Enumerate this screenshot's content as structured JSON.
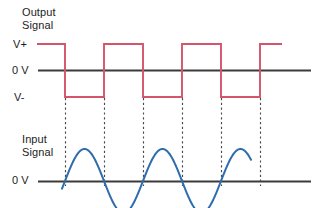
{
  "figure": {
    "title_output": "Output\nSignal",
    "title_input": "Input\nSignal",
    "axis_labels": {
      "v_plus": "V+",
      "zero_output": "0 V",
      "v_minus": "V-",
      "zero_input": "0 V"
    },
    "colors": {
      "output_wave": "#d4546b",
      "input_wave": "#2f6cab",
      "axis": "#3b3b3b",
      "dashed_guide": "#4a4a4a",
      "text": "#1c1c1c",
      "background": "#ffffff"
    }
  },
  "chart_data": {
    "type": "line",
    "grid": false,
    "legend": false,
    "panels": [
      {
        "name": "output-signal",
        "label": "Output\nSignal",
        "series_name": "Output Signal",
        "waveform": "square",
        "color": "#d4546b",
        "ylabel": "",
        "ytick_labels": [
          "V+",
          "0 V",
          "V-"
        ],
        "ytick_values": [
          1,
          0,
          -1
        ],
        "ylim": [
          -1.35,
          1.35
        ],
        "xlim": [
          0,
          319
        ],
        "starts_high": true,
        "x_start": 37,
        "x_end": 282,
        "transition_x": [
          65,
          104,
          143,
          182,
          221,
          260
        ],
        "levels_px": {
          "v_plus": 44,
          "zero": 70,
          "v_minus": 97
        },
        "points": [
          {
            "x": 37,
            "y": 1
          },
          {
            "x": 65,
            "y": 1
          },
          {
            "x": 65,
            "y": -1
          },
          {
            "x": 104,
            "y": -1
          },
          {
            "x": 104,
            "y": 1
          },
          {
            "x": 143,
            "y": 1
          },
          {
            "x": 143,
            "y": -1
          },
          {
            "x": 182,
            "y": -1
          },
          {
            "x": 182,
            "y": 1
          },
          {
            "x": 221,
            "y": 1
          },
          {
            "x": 221,
            "y": -1
          },
          {
            "x": 260,
            "y": -1
          },
          {
            "x": 260,
            "y": 1
          },
          {
            "x": 282,
            "y": 1
          }
        ]
      },
      {
        "name": "input-signal",
        "label": "Input\nSignal",
        "series_name": "Input Signal",
        "waveform": "sine",
        "color": "#2f6cab",
        "ylabel": "",
        "ytick_labels": [
          "0 V"
        ],
        "ytick_values": [
          0
        ],
        "ylim": [
          -1.3,
          1.3
        ],
        "xlim": [
          0,
          319
        ],
        "amplitude_px": 32,
        "period_px": 78,
        "zero_baseline_px": 181,
        "x_start": 62,
        "x_end": 251,
        "zero_crossings_x": [
          65,
          104,
          143,
          182,
          221,
          250
        ],
        "peaks_x": [
          84,
          162,
          240
        ],
        "troughs_x": [
          123,
          201
        ]
      }
    ],
    "dashed_guides_x": [
      65,
      104,
      143,
      182,
      221,
      260
    ],
    "dashed_guide_y_top": 98,
    "dashed_guide_y_bottom": 186
  }
}
